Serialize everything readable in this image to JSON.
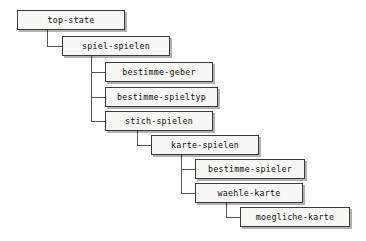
{
  "diagram": {
    "type": "hierarchy-tree",
    "title": "",
    "language": "de",
    "style": {
      "box_fill": "#f7f7f5",
      "box_border": "#3a3a3a",
      "text_color": "#111111",
      "connector_color": "#555555",
      "shadow_color": "rgba(0,0,0,0.30)",
      "background": "#ffffff"
    },
    "nodes": [
      {
        "id": "top-state",
        "label": "top-state",
        "depth": 0,
        "parent": null,
        "x": 17,
        "y": 10,
        "width": 108,
        "height": 20
      },
      {
        "id": "spiel-spielen",
        "label": "spiel-spielen",
        "depth": 1,
        "parent": "top-state",
        "x": 62,
        "y": 36,
        "width": 108,
        "height": 20
      },
      {
        "id": "bestimme-geber",
        "label": "bestimme-geber",
        "depth": 2,
        "parent": "spiel-spielen",
        "x": 105,
        "y": 62,
        "width": 108,
        "height": 20
      },
      {
        "id": "bestimme-spieltyp",
        "label": "bestimme-spieltyp",
        "depth": 2,
        "parent": "spiel-spielen",
        "x": 105,
        "y": 87,
        "width": 113,
        "height": 20
      },
      {
        "id": "stich-spielen",
        "label": "stich-spielen",
        "depth": 2,
        "parent": "spiel-spielen",
        "x": 105,
        "y": 111,
        "width": 108,
        "height": 20
      },
      {
        "id": "karte-spielen",
        "label": "karte-spielen",
        "depth": 3,
        "parent": "stich-spielen",
        "x": 151,
        "y": 135,
        "width": 108,
        "height": 20
      },
      {
        "id": "bestimme-spieler",
        "label": "bestimme-spieler",
        "depth": 4,
        "parent": "karte-spielen",
        "x": 195,
        "y": 159,
        "width": 110,
        "height": 20
      },
      {
        "id": "waehle-karte",
        "label": "waehle-karte",
        "depth": 4,
        "parent": "karte-spielen",
        "x": 195,
        "y": 183,
        "width": 108,
        "height": 20
      },
      {
        "id": "moegliche-karte",
        "label": "moegliche-karte",
        "depth": 5,
        "parent": "waehle-karte",
        "x": 240,
        "y": 207,
        "width": 110,
        "height": 20
      }
    ],
    "connectors": [
      {
        "from": "top-state",
        "to": "spiel-spielen",
        "trunk_x": 47,
        "from_y": 30,
        "to_y": 46,
        "to_x": 62
      },
      {
        "from": "spiel-spielen",
        "to": "bestimme-geber",
        "trunk_x": 91,
        "from_y": 56,
        "to_y": 72,
        "to_x": 105
      },
      {
        "from": "spiel-spielen",
        "to": "bestimme-spieltyp",
        "trunk_x": 91,
        "from_y": 56,
        "to_y": 97,
        "to_x": 105
      },
      {
        "from": "spiel-spielen",
        "to": "stich-spielen",
        "trunk_x": 91,
        "from_y": 56,
        "to_y": 121,
        "to_x": 105
      },
      {
        "from": "stich-spielen",
        "to": "karte-spielen",
        "trunk_x": 137,
        "from_y": 131,
        "to_y": 145,
        "to_x": 151
      },
      {
        "from": "karte-spielen",
        "to": "bestimme-spieler",
        "trunk_x": 181,
        "from_y": 155,
        "to_y": 169,
        "to_x": 195
      },
      {
        "from": "karte-spielen",
        "to": "waehle-karte",
        "trunk_x": 181,
        "from_y": 155,
        "to_y": 193,
        "to_x": 195
      },
      {
        "from": "waehle-karte",
        "to": "moegliche-karte",
        "trunk_x": 226,
        "from_y": 203,
        "to_y": 217,
        "to_x": 240
      }
    ]
  }
}
